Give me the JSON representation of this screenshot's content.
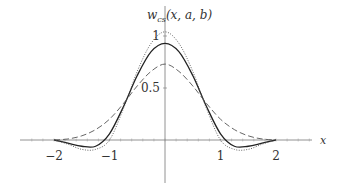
{
  "chart_data": {
    "type": "line",
    "title": "",
    "ylabel": "w_cs(x, a, b)",
    "xlabel": "x",
    "xlim": [
      -2.5,
      3.0
    ],
    "ylim": [
      -0.45,
      1.1
    ],
    "grid": false,
    "legend": null,
    "x_ticks": [
      -2,
      -1,
      1,
      2
    ],
    "x_tick_labels": [
      "−2",
      "−1",
      "1",
      "2"
    ],
    "y_ticks": [
      0.5,
      1
    ],
    "y_tick_labels": [
      "0.5",
      "1"
    ],
    "series": [
      {
        "name": "solid",
        "style": "solid",
        "x": [
          -2,
          -1.75,
          -1.5,
          -1.25,
          -1,
          -0.75,
          -0.5,
          -0.25,
          0,
          0.25,
          0.5,
          0.75,
          1,
          1.25,
          1.5,
          1.75,
          2
        ],
        "y": [
          0,
          -0.03,
          -0.06,
          -0.06,
          0.06,
          0.32,
          0.62,
          0.85,
          0.93,
          0.85,
          0.62,
          0.32,
          0.06,
          -0.06,
          -0.06,
          -0.03,
          0
        ]
      },
      {
        "name": "dotted",
        "style": "dotted",
        "x": [
          -2,
          -1.75,
          -1.5,
          -1.25,
          -1,
          -0.75,
          -0.5,
          -0.25,
          0,
          0.25,
          0.5,
          0.75,
          1,
          1.25,
          1.5,
          1.75,
          2
        ],
        "y": [
          0,
          -0.04,
          -0.09,
          -0.09,
          0.0,
          0.3,
          0.66,
          0.93,
          1.04,
          0.93,
          0.66,
          0.3,
          0.0,
          -0.09,
          -0.09,
          -0.04,
          0
        ]
      },
      {
        "name": "dashed",
        "style": "dashed",
        "x": [
          -2,
          -1.75,
          -1.5,
          -1.25,
          -1,
          -0.75,
          -0.5,
          -0.25,
          0,
          0.25,
          0.5,
          0.75,
          1,
          1.25,
          1.5,
          1.75,
          2
        ],
        "y": [
          0,
          0.01,
          0.04,
          0.1,
          0.2,
          0.35,
          0.52,
          0.66,
          0.73,
          0.66,
          0.52,
          0.35,
          0.2,
          0.1,
          0.04,
          0.01,
          0
        ]
      }
    ]
  },
  "labels": {
    "ylabel_main": "w",
    "ylabel_sub": "cs",
    "ylabel_args": "(x, a, b)",
    "xlabel": "x"
  }
}
